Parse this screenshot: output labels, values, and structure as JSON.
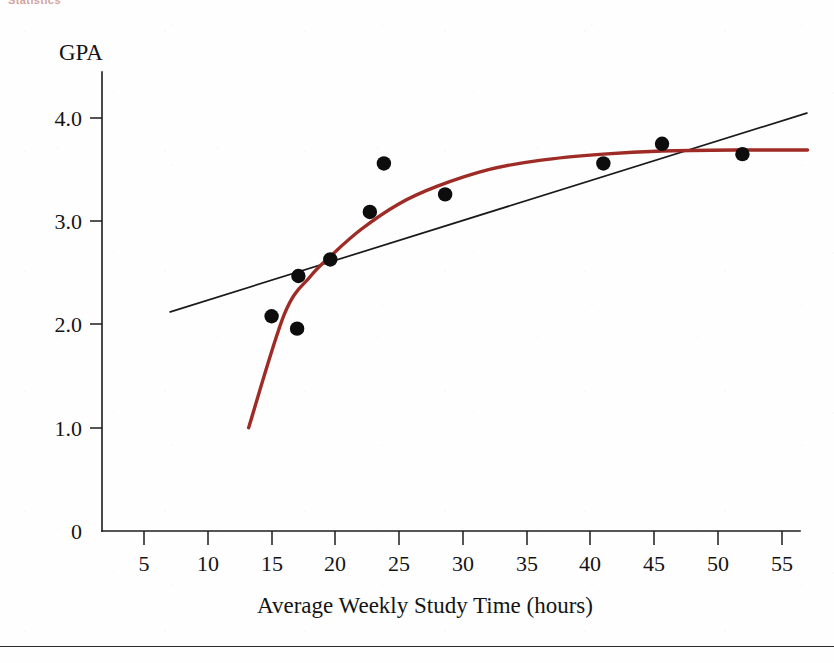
{
  "figure": {
    "cropped_header_text": "Statistics",
    "y_axis_label": "GPA",
    "x_axis_label": "Average Weekly Study Time (hours)"
  },
  "chart_data": {
    "type": "scatter",
    "title": "",
    "xlabel": "Average Weekly Study Time (hours)",
    "ylabel": "GPA",
    "xlim": [
      2,
      57.5
    ],
    "ylim": [
      0,
      4.3
    ],
    "grid": false,
    "legend": "none",
    "x_ticks": [
      5,
      10,
      15,
      20,
      25,
      30,
      35,
      40,
      45,
      50,
      55
    ],
    "x_tick_labels": [
      "5",
      "10",
      "15",
      "20",
      "25",
      "30",
      "35",
      "40",
      "45",
      "50",
      "55"
    ],
    "y_ticks": [
      0,
      1.0,
      2.0,
      3.0,
      4.0
    ],
    "y_tick_labels": [
      "0",
      "1.0",
      "2.0",
      "3.0",
      "4.0"
    ],
    "points": [
      {
        "x": 15.0,
        "y": 2.08
      },
      {
        "x": 17.1,
        "y": 2.47
      },
      {
        "x": 17.0,
        "y": 1.96
      },
      {
        "x": 19.6,
        "y": 2.63
      },
      {
        "x": 22.7,
        "y": 3.09
      },
      {
        "x": 23.8,
        "y": 3.56
      },
      {
        "x": 28.6,
        "y": 3.26
      },
      {
        "x": 41.0,
        "y": 3.56
      },
      {
        "x": 45.6,
        "y": 3.75
      },
      {
        "x": 51.9,
        "y": 3.65
      }
    ],
    "series": [
      {
        "name": "data-points",
        "type": "scatter",
        "marker": "filled-circle",
        "color": "#0d0d0d",
        "x": [
          15.0,
          17.1,
          17.0,
          19.6,
          22.7,
          23.8,
          28.6,
          41.0,
          45.6,
          51.9
        ],
        "values": [
          2.08,
          2.47,
          1.96,
          2.63,
          3.09,
          3.56,
          3.26,
          3.56,
          3.75,
          3.65
        ]
      },
      {
        "name": "linear-fit",
        "type": "line",
        "color": "#1a1a1a",
        "x": [
          7.0,
          57.0
        ],
        "values": [
          2.12,
          4.05
        ]
      },
      {
        "name": "logarithmic-fit",
        "type": "line",
        "color": "#9e2b25",
        "x": [
          13.2,
          16.0,
          18.0,
          19.6,
          22.0,
          25.0,
          28.0,
          32.0,
          36.0,
          41.0,
          45.6,
          51.9,
          57.0
        ],
        "values": [
          1.0,
          2.1,
          2.46,
          2.66,
          2.92,
          3.17,
          3.34,
          3.5,
          3.59,
          3.65,
          3.68,
          3.69,
          3.69
        ]
      }
    ],
    "colors": {
      "points": "#0d0d0d",
      "linear_fit": "#1a1a1a",
      "curve_fit": "#9e2b25",
      "axis": "#1c1c1c",
      "background": "#fefefe"
    }
  }
}
